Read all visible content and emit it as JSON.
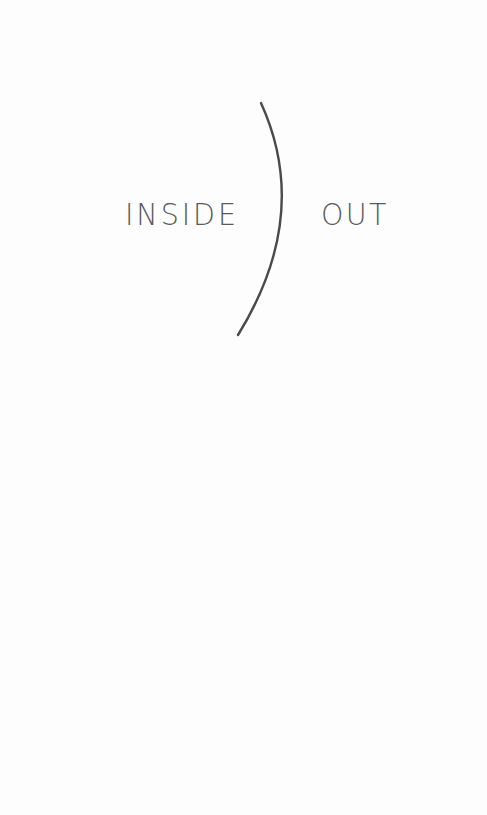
{
  "cover": {
    "title_left": "INSIDE",
    "title_right": "OUT",
    "divider": "parenthesis-arc-icon",
    "colors": {
      "background": "#fdfdfd",
      "text": "#5a5a5a",
      "arc": "#4a4a4a"
    }
  }
}
